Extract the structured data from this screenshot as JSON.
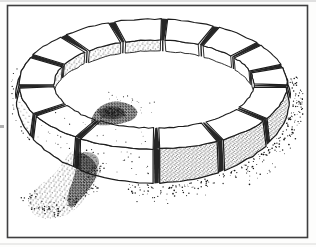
{
  "illustration": {
    "subject": "pen-and-ink line drawing of a circular ring of rectangular stone blocks (kerb ring) seen in perspective, with stippled shading, a dark rubble mound on the inner front-left rim and a stippled earthen ramp spilling to the lower left",
    "canvas": {
      "width": 316,
      "height": 247
    },
    "colors": {
      "paper": "#fdfdfc",
      "ink": "#1c1c1c",
      "joint_dark": "#262626",
      "dot": "#161616",
      "frame_stroke": "#3f3f3f",
      "scan_edge": "#c9c9c9"
    },
    "frame": {
      "x": 7.5,
      "y": 5.5,
      "width": 300,
      "height": 232,
      "stroke_width": 1.6
    },
    "ring": {
      "block_count": 14,
      "joints_deg": [
        2,
        33,
        60,
        88.5,
        124,
        152,
        178,
        205,
        228,
        252,
        275,
        298,
        322,
        344
      ],
      "gap_half_deg": 1.5,
      "outer_top": {
        "cx": 153,
        "cy": 84,
        "rx": 134,
        "ry": 65
      },
      "inner_top": {
        "cx": 154,
        "cy": 84,
        "rx": 100,
        "ry": 44
      },
      "outer_base": {
        "cx": 153,
        "cy": 97,
        "rx": 137,
        "ry": 86
      },
      "floor": {
        "cx": 154,
        "cy": 98,
        "rx": 101,
        "ry": 47
      },
      "shading": {
        "outer_dense_deg": [
          5,
          82
        ],
        "outer_sparse_deg": [
          145,
          200
        ],
        "inner_stippled_deg": [
          184,
          268
        ],
        "outer_visible_deg": [
          -22,
          202
        ]
      }
    },
    "features": {
      "mound_path": "M 91,121 C 93,112 100,105 109,102.5 C 118,100 129,103 135,108 C 139,111.5 137.5,117.5 131,120.5 C 122,124.5 106,126 98,125 C 93,124.5 90.5,123 91,121 Z",
      "mound_core": {
        "cx": 112,
        "cy": 113,
        "rx": 13,
        "ry": 6.5
      },
      "ramp_path": "M 80,150 C 90,153 98,158 100,165 C 102,172 97,180 91,189 C 85,198 80,207 70,213 C 60,219 44,221 35,215 C 28,210 26,201 30,195 C 35,187 44,183 52,176 C 59,170 64,160 69,154 C 72,150 76,149 80,150 Z",
      "ramp_core_path": "M 80,152 C 88,155 95,160 97,167 C 99,173 95,181 89,189 C 84,196 78,203 71,208 C 66,203 67,196 70,188 C 74,179 76,169 77,161 C 77,156 78,152 80,152 Z",
      "ramp_top_shadow": {
        "cx": 87,
        "cy": 162,
        "rx": 12,
        "ry": 10
      },
      "ramp_spine": [
        [
          82,
          156
        ],
        [
          95,
          170
        ],
        [
          90,
          188
        ],
        [
          75,
          203
        ],
        [
          55,
          210
        ],
        [
          38,
          208
        ],
        [
          30,
          198
        ]
      ]
    },
    "stipple_seed": 7,
    "scatter": {
      "right_ground_dots": 300,
      "left_ground_dots": 26,
      "ramp_edge_dots": 120,
      "front_face_dots": 26,
      "left_face_dots": 12,
      "top_face_dots": 16,
      "mound_halo_dots": 85,
      "mound_trail_dots": 22,
      "mound_stray_dots": 10
    }
  }
}
